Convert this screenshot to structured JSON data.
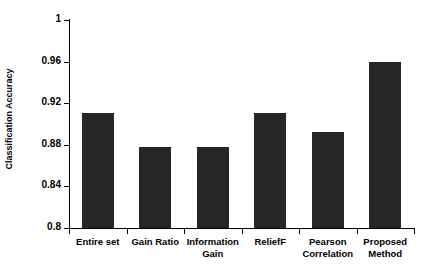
{
  "chart_data": {
    "type": "bar",
    "title": "",
    "xlabel": "",
    "ylabel": "Classification Accuracy",
    "categories": [
      "Entire set",
      "Information Gain",
      "Gain Ratio",
      "ReliefF",
      "Pearson Correlation",
      "Proposed Method"
    ],
    "categories_display": [
      [
        "Entire set"
      ],
      [
        "Gain Ratio"
      ],
      [
        "Information",
        "Gain"
      ],
      [
        "ReliefF"
      ],
      [
        "Pearson",
        "Correlation"
      ],
      [
        "Proposed",
        "Method"
      ]
    ],
    "category_order": [
      "Entire set",
      "Gain Ratio",
      "Information Gain",
      "ReliefF",
      "Pearson Correlation",
      "Proposed Method"
    ],
    "values": [
      0.9105,
      0.878,
      0.878,
      0.9105,
      0.892,
      0.9595
    ],
    "ylim": [
      0.8,
      1.0
    ],
    "ytick_values": [
      0.8,
      0.84,
      0.88,
      0.92,
      0.96,
      1.0
    ],
    "ytick_labels": [
      "0.8",
      "0.84",
      "0.88",
      "0.92",
      "0.96",
      "1"
    ],
    "grid": false,
    "legend": null,
    "legend_position": "none",
    "bar_color": "#262626",
    "axis_color": "#000000",
    "background_color": "#ffffff"
  }
}
